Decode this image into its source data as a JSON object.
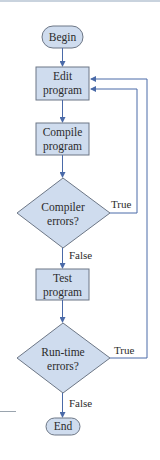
{
  "diagram": {
    "type": "flowchart",
    "colors": {
      "node_fill": "#cfdcee",
      "node_stroke": "#6d7786",
      "edge": "#4a6aa8",
      "text": "#2b2b2b"
    },
    "nodes": {
      "begin": {
        "shape": "terminator",
        "label": "Begin"
      },
      "edit": {
        "shape": "process",
        "line1": "Edit",
        "line2": "program"
      },
      "compile": {
        "shape": "process",
        "line1": "Compile",
        "line2": "program"
      },
      "compiler_errors": {
        "shape": "decision",
        "line1": "Compiler",
        "line2": "errors?"
      },
      "test": {
        "shape": "process",
        "line1": "Test",
        "line2": "program"
      },
      "runtime_errors": {
        "shape": "decision",
        "line1": "Run-time",
        "line2": "errors?"
      },
      "end": {
        "shape": "terminator",
        "label": "End"
      }
    },
    "edges": {
      "compiler_true": "True",
      "compiler_false": "False",
      "runtime_true": "True",
      "runtime_false": "False"
    }
  }
}
